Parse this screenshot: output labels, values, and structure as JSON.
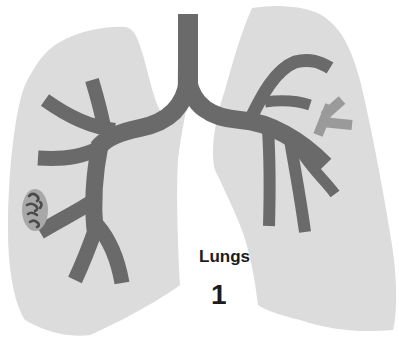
{
  "figure": {
    "subject": "lungs",
    "colors": {
      "background": "#ffffff",
      "lung_fill": "#dcdcdc",
      "bronchi": "#6a6a6a",
      "secondary_branch": "#9a9a9a",
      "lesion_fill": "#a8a8a8",
      "lesion_marks": "#4a4a4a",
      "text": "#1c1c1c"
    },
    "parts": {
      "left_lung": "left-lung",
      "right_lung": "right-lung",
      "trachea": "trachea",
      "bronchial_tree": "bronchial-tree",
      "highlighted_branch": "highlighted-branch",
      "lesion": "lesion"
    }
  },
  "caption": {
    "title": "Lungs",
    "number": "1"
  }
}
